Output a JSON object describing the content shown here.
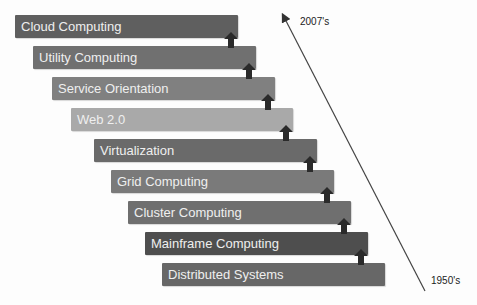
{
  "diagram": {
    "stages": [
      {
        "label": "Cloud Computing",
        "color": "#5f5f5f"
      },
      {
        "label": "Utility Computing",
        "color": "#707070"
      },
      {
        "label": "Service Orientation",
        "color": "#808080"
      },
      {
        "label": "Web 2.0",
        "color": "#a9a9a9"
      },
      {
        "label": "Virtualization",
        "color": "#6a6a6a"
      },
      {
        "label": "Grid Computing",
        "color": "#7a7a7a"
      },
      {
        "label": "Cluster Computing",
        "color": "#6f6f6f"
      },
      {
        "label": "Mainframe Computing",
        "color": "#4e4e4e"
      },
      {
        "label": "Distributed Systems",
        "color": "#676767"
      }
    ],
    "timeline": {
      "top_label": "2007's",
      "bottom_label": "1950's"
    }
  }
}
